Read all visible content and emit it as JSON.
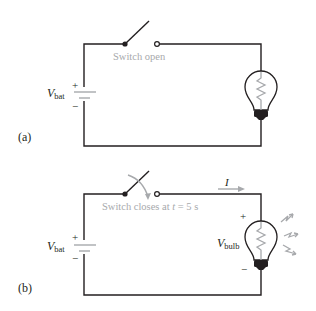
{
  "panels": [
    {
      "id": "a",
      "label": "(a)",
      "switch_label": "Switch open",
      "battery_label_main": "V",
      "battery_label_sub": "bat",
      "battery_plus": "+",
      "battery_minus": "−"
    },
    {
      "id": "b",
      "label": "(b)",
      "switch_label_prefix": "Switch closes at ",
      "switch_label_var": "t",
      "switch_label_suffix": " = 5 s",
      "battery_label_main": "V",
      "battery_label_sub": "bat",
      "battery_plus": "+",
      "battery_minus": "−",
      "current_label": "I",
      "bulb_label_main": "V",
      "bulb_label_sub": "bulb",
      "bulb_plus": "+",
      "bulb_minus": "−"
    }
  ],
  "colors": {
    "wire": "#231f20",
    "annotation": "#a7a9ac",
    "bulb_base": "#231f20"
  }
}
